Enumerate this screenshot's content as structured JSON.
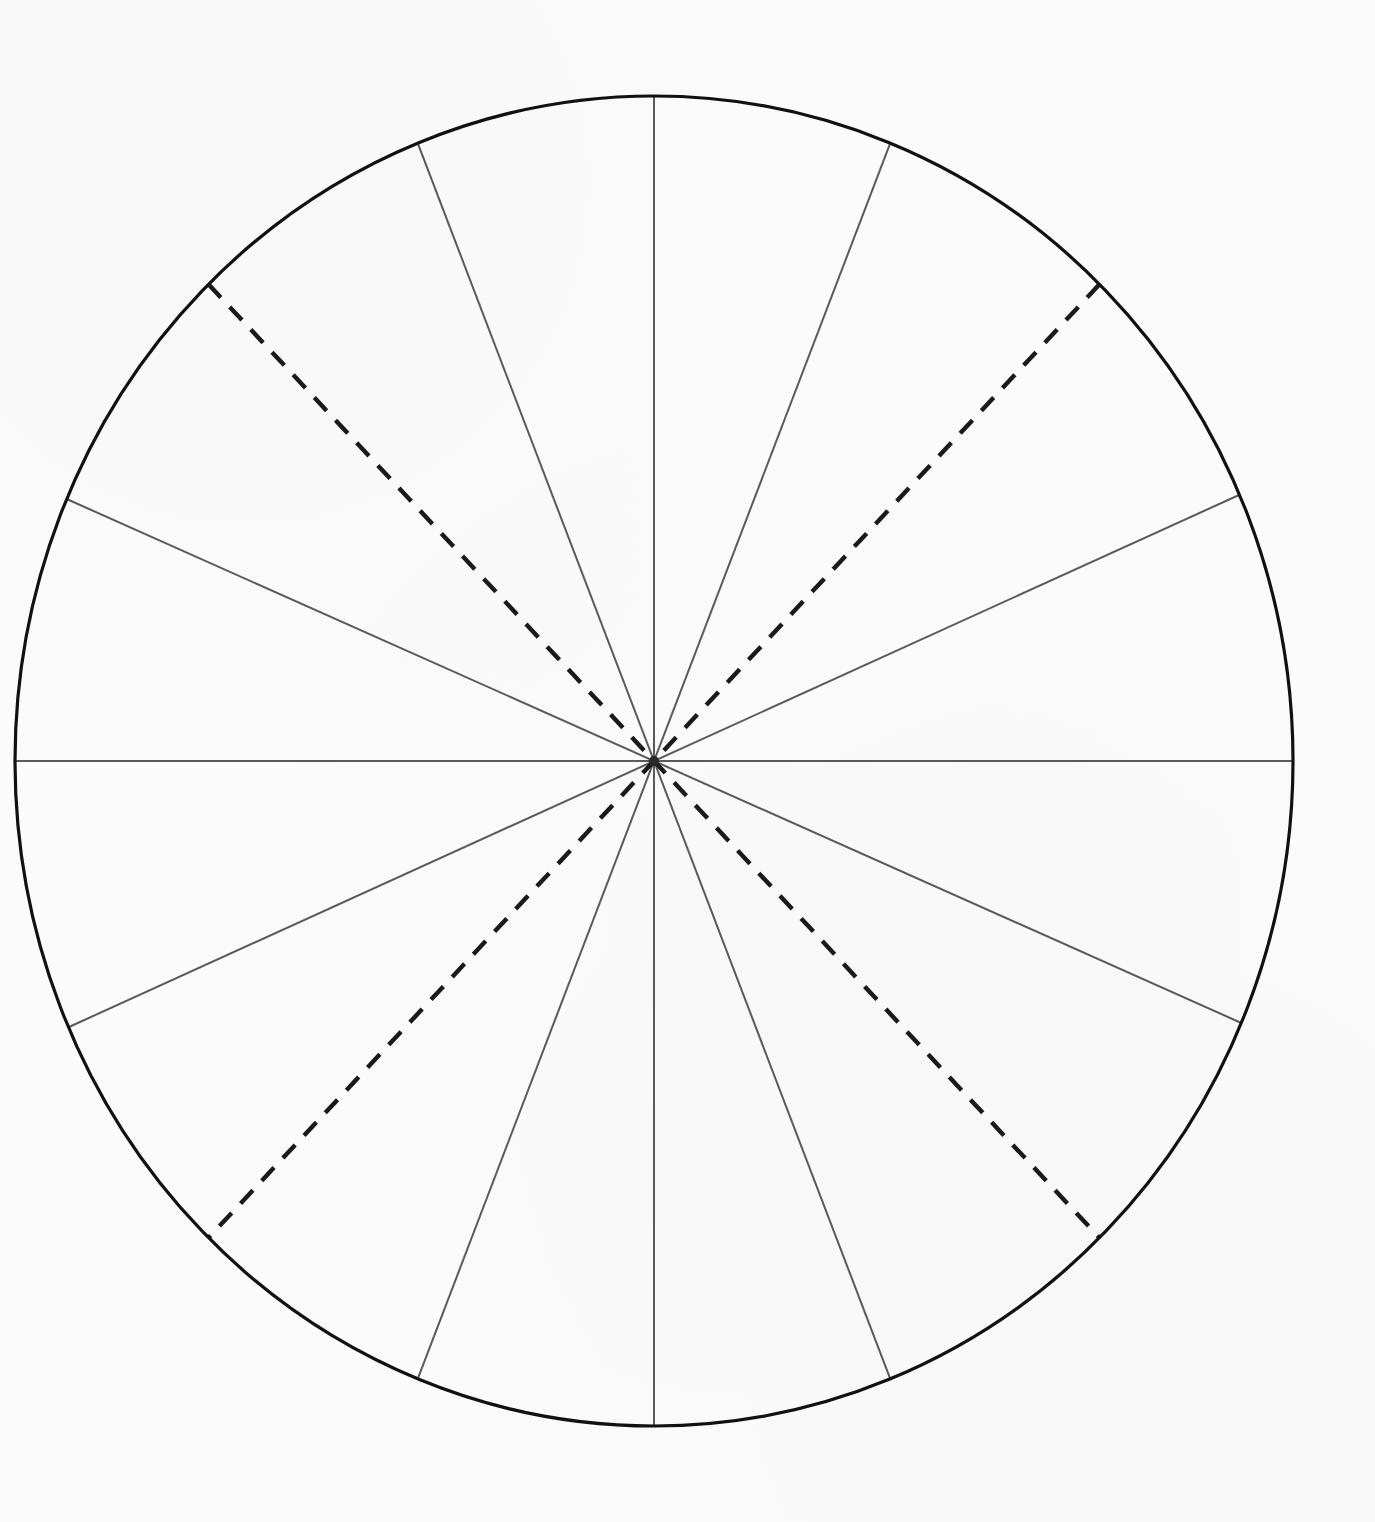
{
  "page": {
    "background_color": "#fbfbfb",
    "width": 1375,
    "height": 1522,
    "title": ""
  },
  "chart_data": {
    "type": "pie",
    "title": "",
    "subtitle": "",
    "xlabel": "",
    "ylabel": "",
    "legend": [],
    "annotations": [],
    "grid": false,
    "note": "Blank unlabeled pie / circle chart template: one outer ellipse outline divided into 14 sectors by 7 full diameters drawn through the centre. Two of the diameters (the two at 46 degrees from horizontal) are drawn with a dashed stroke; the remaining five are solid. No text, tick labels, numbers or legend are present anywhere in the figure.",
    "geometry": {
      "center_x": 654,
      "center_y": 761,
      "radius_x": 639,
      "radius_y": 665,
      "outline_color": "#111111",
      "outline_width": 3.2,
      "spoke_color": "#5a5a5a",
      "spoke_width": 2.0,
      "dashed_color": "#1a1a1a",
      "dashed_width": 4.4,
      "dash_pattern": "18 13"
    },
    "categories": [
      "sector-1",
      "sector-2",
      "sector-3",
      "sector-4",
      "sector-5",
      "sector-6",
      "sector-7",
      "sector-8",
      "sector-9",
      "sector-10",
      "sector-11",
      "sector-12",
      "sector-13",
      "sector-14"
    ],
    "values": [
      21.7,
      24.4,
      23.9,
      23.3,
      22.9,
      22.8,
      21.0,
      21.4,
      24.6,
      23.0,
      23.8,
      22.7,
      22.2,
      22.3
    ],
    "value_unit": "degrees",
    "total_degrees": 360,
    "diameters": [
      {
        "id": "diameter-vertical",
        "angle_deg": 90.0,
        "style": "solid",
        "x1": 654,
        "y1": 96,
        "x2": 654,
        "y2": 1426
      },
      {
        "id": "diameter-horizontal",
        "angle_deg": 0.0,
        "style": "solid",
        "x1": 15,
        "y1": 758,
        "x2": 1293,
        "y2": 763
      },
      {
        "id": "diameter-upleft-steep",
        "angle_deg": 68.3,
        "style": "solid",
        "x1": 410,
        "y1": 147,
        "x2": 897,
        "y2": 1375
      },
      {
        "id": "diameter-upright-steep",
        "angle_deg": 111.7,
        "style": "solid",
        "x1": 898,
        "y1": 149,
        "x2": 409,
        "y2": 1374
      },
      {
        "id": "diameter-left-shallow",
        "angle_deg": 23.6,
        "style": "solid",
        "x1": 63,
        "y1": 503,
        "x2": 1240,
        "y2": 1020
      },
      {
        "id": "diameter-right-shallow",
        "angle_deg": 156.8,
        "style": "solid",
        "x1": 1245,
        "y1": 512,
        "x2": 65,
        "y2": 1010
      },
      {
        "id": "diameter-dashed-nwse",
        "angle_deg": 45.8,
        "style": "dashed",
        "x1": 200,
        "y1": 290,
        "x2": 1098,
        "y2": 1234
      },
      {
        "id": "diameter-dashed-nesw",
        "angle_deg": 134.2,
        "style": "dashed",
        "x1": 1105,
        "y1": 298,
        "x2": 202,
        "y2": 1225
      }
    ]
  }
}
